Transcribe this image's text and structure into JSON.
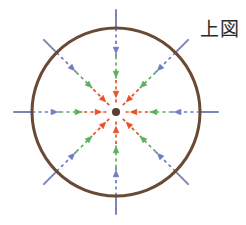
{
  "figure": {
    "caption": "上図",
    "caption_meaning": "upper figure",
    "background_color": "#ffffff",
    "width": 246,
    "height": 225
  },
  "chart_data": {
    "type": "scatter",
    "title": "上図",
    "subtitle": "",
    "xlabel": "",
    "ylabel": "",
    "grid": false,
    "legend_position": "none",
    "center": {
      "x": 116,
      "y": 112,
      "dot_radius": 4,
      "dot_color": "#5a3a32",
      "label": ""
    },
    "boundary_circle": {
      "radius": 84,
      "stroke_color": "#6b4a35",
      "stroke_width": 3,
      "fill": "none"
    },
    "spokes": {
      "count": 8,
      "angles_deg": [
        0,
        45,
        90,
        135,
        180,
        225,
        270,
        315
      ],
      "direction": "inward",
      "outside_segment": {
        "color": "#7b85b8",
        "style": "solid",
        "inner_radius": 84,
        "outer_radius": 102,
        "stroke_width": 2
      }
    },
    "rings": [
      {
        "name": "outer",
        "color": "#6f7cc0",
        "color_hex": "#6f7cc0",
        "style": "dashed",
        "arrow_radius": 62,
        "segment_from_radius": 84,
        "segment_to_radius": 56,
        "arrow_count": 8
      },
      {
        "name": "middle",
        "color": "#5fae5f",
        "color_hex": "#5fae5f",
        "style": "dashed",
        "arrow_radius": 38,
        "segment_from_radius": 56,
        "segment_to_radius": 32,
        "arrow_count": 8
      },
      {
        "name": "inner",
        "color": "#e8512a",
        "color_hex": "#e8512a",
        "style": "dashed",
        "arrow_radius": 18,
        "segment_from_radius": 32,
        "segment_to_radius": 7,
        "arrow_count": 8
      }
    ],
    "colors": {
      "outer_ring": "#6f7cc0",
      "middle_ring": "#5fae5f",
      "inner_ring": "#e8512a",
      "circle_outline": "#6b4a35",
      "center_dot": "#5a3a32",
      "spoke_outside": "#7b85b8",
      "caption_text": "#2b2b2b",
      "background": "#ffffff"
    }
  }
}
